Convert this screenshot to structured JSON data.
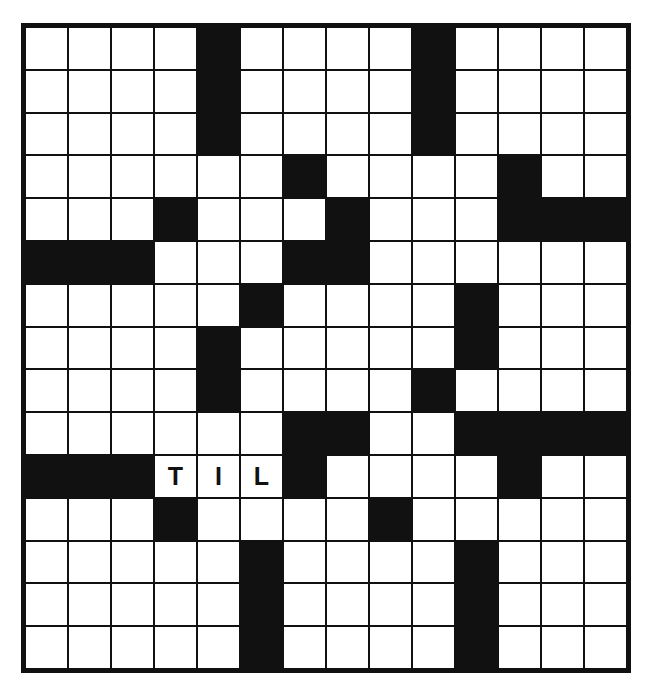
{
  "puzzle": {
    "kind": "crossword-grid",
    "columns": 14,
    "rows": 15,
    "colors": {
      "block": "#111111",
      "open": "#ffffff",
      "grid_line": "#111111",
      "letter": "#111111",
      "page_background": "#ffffff"
    },
    "legend": {
      "block_char": "#",
      "open_char": "."
    },
    "grid": [
      "....#....#....",
      "....#....#....",
      "....#....#....",
      "......#....#..",
      "...#...#...###",
      "###...##......",
      ".....#....#...",
      "....#.....#...",
      "....#....#....",
      "......##..####",
      "###TIL#....#..",
      "...#....#.....",
      ".....#....#...",
      ".....#....#...",
      ".....#....#..."
    ],
    "filled_letters": [
      {
        "row": 10,
        "col": 3,
        "letter": "T"
      },
      {
        "row": 10,
        "col": 4,
        "letter": "I"
      },
      {
        "row": 10,
        "col": 5,
        "letter": "L"
      }
    ],
    "answer_fragment": "TIL",
    "counts": {
      "total_cells": 210,
      "block_cells": 53,
      "open_cells": 157,
      "letters_entered": 3
    }
  }
}
